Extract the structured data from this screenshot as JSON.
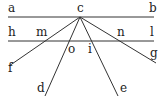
{
  "diagram": {
    "title": "",
    "points": {
      "c": {
        "x": 80,
        "y": 17
      },
      "a_end": {
        "x": 8,
        "y": 17
      },
      "b_end": {
        "x": 154,
        "y": 17
      },
      "h_end": {
        "x": 8,
        "y": 41
      },
      "l_end": {
        "x": 154,
        "y": 41
      },
      "f_end": {
        "x": 9,
        "y": 66
      },
      "d_end": {
        "x": 45,
        "y": 96
      },
      "e_end": {
        "x": 118,
        "y": 96
      },
      "g_end": {
        "x": 156,
        "y": 63
      }
    },
    "labels": [
      {
        "id": "a",
        "text": "a",
        "x": 8,
        "y": 12
      },
      {
        "id": "b",
        "text": "b",
        "x": 149,
        "y": 12
      },
      {
        "id": "c",
        "text": "c",
        "x": 77,
        "y": 12
      },
      {
        "id": "h",
        "text": "h",
        "x": 8,
        "y": 36
      },
      {
        "id": "m",
        "text": "m",
        "x": 36,
        "y": 36
      },
      {
        "id": "n",
        "text": "n",
        "x": 117,
        "y": 36
      },
      {
        "id": "l",
        "text": "l",
        "x": 150,
        "y": 36
      },
      {
        "id": "o",
        "text": "o",
        "x": 68,
        "y": 53
      },
      {
        "id": "i",
        "text": "i",
        "x": 88,
        "y": 53
      },
      {
        "id": "f",
        "text": "f",
        "x": 8,
        "y": 72
      },
      {
        "id": "g",
        "text": "g",
        "x": 150,
        "y": 57
      },
      {
        "id": "d",
        "text": "d",
        "x": 37,
        "y": 92
      },
      {
        "id": "e",
        "text": "e",
        "x": 120,
        "y": 92
      }
    ],
    "lines": [
      {
        "name": "line-ab",
        "from": "a",
        "to": "b"
      },
      {
        "name": "line-hl",
        "from": "h",
        "to": "l"
      }
    ],
    "rays": [
      {
        "name": "ray-cf",
        "from": "c",
        "to": "f"
      },
      {
        "name": "ray-cd",
        "from": "c",
        "to": "d"
      },
      {
        "name": "ray-ce",
        "from": "c",
        "to": "e"
      },
      {
        "name": "ray-cg",
        "from": "c",
        "to": "g"
      }
    ]
  }
}
